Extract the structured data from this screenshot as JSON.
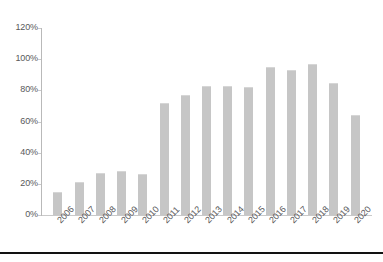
{
  "chart_data": {
    "type": "bar",
    "title": "",
    "subtitle": "",
    "xlabel": "",
    "ylabel": "",
    "categories": [
      "2006",
      "2007",
      "2008",
      "2009",
      "2010",
      "2011",
      "2012",
      "2013",
      "2014",
      "2015",
      "2016",
      "2017",
      "2018",
      "2019",
      "2020"
    ],
    "values": [
      15,
      21,
      27,
      28,
      26,
      72,
      77,
      83,
      83,
      82,
      95,
      93,
      97,
      85,
      64
    ],
    "value_suffix": "%",
    "ylim": [
      0,
      120
    ],
    "ytick_labels": [
      "0%",
      "20%",
      "40%",
      "60%",
      "80%",
      "100%",
      "120%"
    ],
    "ytick_values": [
      0,
      20,
      40,
      60,
      80,
      100,
      120
    ],
    "grid": false,
    "legend": "none",
    "series": [
      {
        "name": "",
        "values": [
          15,
          21,
          27,
          28,
          26,
          72,
          77,
          83,
          83,
          82,
          95,
          93,
          97,
          85,
          64
        ]
      }
    ],
    "colors": {
      "bar_fill": "#c6c6c6",
      "axis": "#c9c9c9",
      "tick_text": "#58585a",
      "background": "#ffffff",
      "bottom_rule": "#121212"
    },
    "x_label_rotation_deg": -45
  }
}
